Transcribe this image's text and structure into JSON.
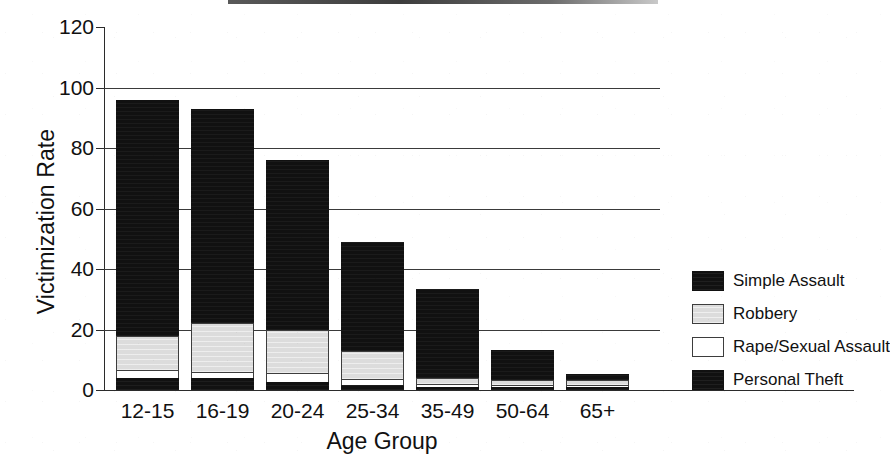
{
  "chart_data": {
    "type": "bar",
    "subtype": "stacked-bar",
    "title": "",
    "xlabel": "Age Group",
    "ylabel": "Victimization Rate",
    "categories": [
      "12-15",
      "16-19",
      "20-24",
      "25-34",
      "35-49",
      "50-64",
      "65+"
    ],
    "ylim": [
      0,
      120
    ],
    "yticks": [
      0,
      20,
      40,
      60,
      80,
      100,
      120
    ],
    "ytick_labels": [
      "0",
      "20",
      "40",
      "60",
      "80",
      "100",
      "120"
    ],
    "grid": "horizontal",
    "legend_position": "right",
    "stack_order_bottom_to_top": [
      "Personal Theft",
      "Rape/Sexual Assault",
      "Robbery",
      "Simple Assault"
    ],
    "series": [
      {
        "name": "Personal Theft",
        "color": "#111111",
        "values": [
          4.0,
          4.0,
          2.5,
          1.5,
          1.0,
          1.0,
          1.0
        ]
      },
      {
        "name": "Rape/Sexual Assault",
        "color": "#ffffff",
        "values": [
          2.5,
          2.0,
          3.0,
          2.0,
          1.0,
          0.5,
          0.5
        ]
      },
      {
        "name": "Robbery",
        "color": "#dcdcdc",
        "values": [
          11.5,
          16.0,
          14.5,
          9.5,
          2.0,
          1.5,
          1.5
        ]
      },
      {
        "name": "Simple Assault",
        "color": "#111111",
        "values": [
          78.0,
          71.0,
          56.0,
          36.0,
          29.5,
          10.0,
          2.0
        ]
      }
    ],
    "totals": [
      96,
      93,
      76,
      49,
      33.5,
      13,
      5
    ]
  },
  "axes": {
    "y_title": "Victimization Rate",
    "x_title": "Age Group"
  },
  "legend": {
    "items": [
      {
        "label": "Simple Assault",
        "swatch": "swatch-black"
      },
      {
        "label": "Robbery",
        "swatch": "swatch-gray"
      },
      {
        "label": "Rape/Sexual Assault",
        "swatch": "swatch-white"
      },
      {
        "label": "Personal Theft",
        "swatch": "swatch-black"
      }
    ]
  },
  "colors": {
    "simple_assault": "#111111",
    "robbery": "#dcdcdc",
    "rape_sexual_assault": "#ffffff",
    "personal_theft": "#111111",
    "axis": "#2b2b2b",
    "grid": "#3a3a3a",
    "background": "#ffffff"
  }
}
